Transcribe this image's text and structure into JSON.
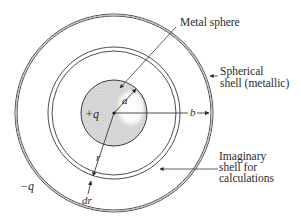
{
  "diagram": {
    "colors": {
      "stroke": "#3a3a3a",
      "sphere_fill": "#d8d8d8",
      "sphere_highlight": "#f4f4f4",
      "text": "#2a2a2a",
      "background": "#ffffff"
    },
    "center": {
      "x": 114,
      "y": 113
    },
    "radii": {
      "sphere_a": 33,
      "imaginary_r": 64,
      "outer_b": 98
    },
    "labels": {
      "metal_sphere": "Metal sphere",
      "spherical_shell_line1": "Spherical",
      "spherical_shell_line2": "shell (metallic)",
      "imaginary_line1": "Imaginary",
      "imaginary_line2": "shell for",
      "imaginary_line3": "calculations",
      "charge_inner": "+q",
      "charge_outer": "−q",
      "radius_a": "a",
      "radius_b": "b",
      "radius_r": "r",
      "thickness_dr": "dr"
    }
  }
}
